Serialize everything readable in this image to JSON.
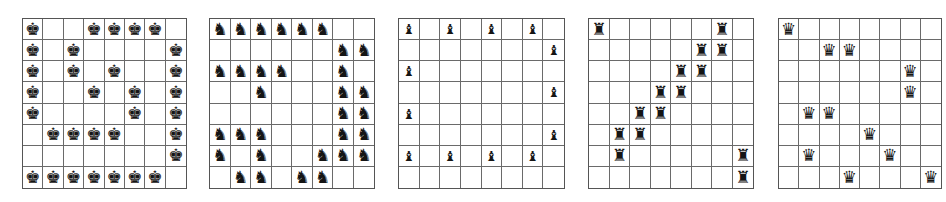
{
  "glyphs": {
    "K": "♚",
    "N": "♞",
    "B": "♝",
    "R": "♜",
    "Q": "♛"
  },
  "piece_names": {
    "K": "king",
    "N": "knight",
    "B": "bishop",
    "R": "rook",
    "Q": "queen"
  },
  "boards": [
    {
      "name": "kings-board",
      "piece": "K",
      "left": 22,
      "width": 165,
      "height": 171,
      "rows": [
        "K..KKKK.",
        "K.K....K",
        "K.K.K..K",
        "K..K.K.K",
        "K....K.K",
        ".KKKK..K",
        ".......K",
        "KKKKKKK."
      ]
    },
    {
      "name": "knights-board",
      "piece": "N",
      "left": 209,
      "width": 166,
      "height": 171,
      "rows": [
        "NNNNNN..",
        "......NN",
        "NNNN..N.",
        "..N...NN",
        "......NN",
        "NNN...NN",
        "N.N..NNN",
        ".NN.NN.."
      ]
    },
    {
      "name": "bishops-board",
      "piece": "B",
      "left": 398,
      "width": 167,
      "height": 171,
      "rows": [
        "B.B.B.B.",
        ".......B",
        "B.......",
        ".......B",
        "B.......",
        ".......B",
        "B.B.B.B.",
        "........"
      ]
    },
    {
      "name": "rooks-board",
      "piece": "R",
      "left": 588,
      "width": 166,
      "height": 171,
      "rows": [
        "R.....R.",
        ".....RR.",
        "....RR..",
        "...RR...",
        "..RR....",
        ".RR.....",
        ".R.....R",
        ".......R"
      ]
    },
    {
      "name": "queens-board",
      "piece": "Q",
      "left": 778,
      "width": 164,
      "height": 171,
      "rows": [
        "Q.......",
        "..QQ....",
        "......Q.",
        "......Q.",
        ".QQ.....",
        "....Q...",
        ".Q...Q..",
        "...Q...Q"
      ]
    }
  ]
}
